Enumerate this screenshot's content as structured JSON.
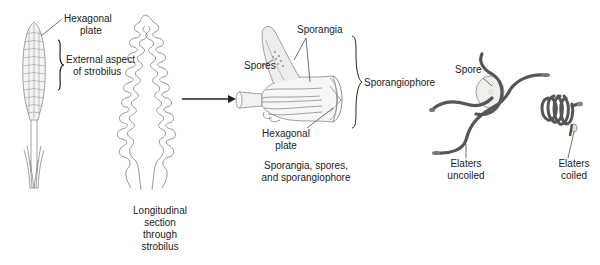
{
  "diagram": {
    "colors": {
      "background": "#ffffff",
      "line": "#8a8a8a",
      "dark_line": "#222222",
      "elater": "#555555",
      "text": "#222222"
    },
    "panels": [
      {
        "id": "external-strobilus",
        "labels": {
          "hexagonal_plate": [
            "Hexagonal",
            "plate"
          ],
          "external_aspect": [
            "External aspect",
            "of strobilus"
          ]
        }
      },
      {
        "id": "longitudinal-section",
        "caption": [
          "Longitudinal",
          "section",
          "through",
          "strobilus"
        ]
      },
      {
        "id": "sporangiophore-detail",
        "labels": {
          "sporangia": "Sporangia",
          "spores": "Spores",
          "sporangiophore": "Sporangiophore",
          "hexagonal_plate": [
            "Hexagonal",
            "plate"
          ]
        },
        "caption": [
          "Sporangia, spores,",
          "and sporangiophore"
        ]
      },
      {
        "id": "elaters-uncoiled",
        "labels": {
          "spore": "Spore",
          "elaters": [
            "Elaters",
            "uncoiled"
          ]
        }
      },
      {
        "id": "elaters-coiled",
        "labels": {
          "elaters": [
            "Elaters",
            "coiled"
          ]
        }
      }
    ]
  }
}
